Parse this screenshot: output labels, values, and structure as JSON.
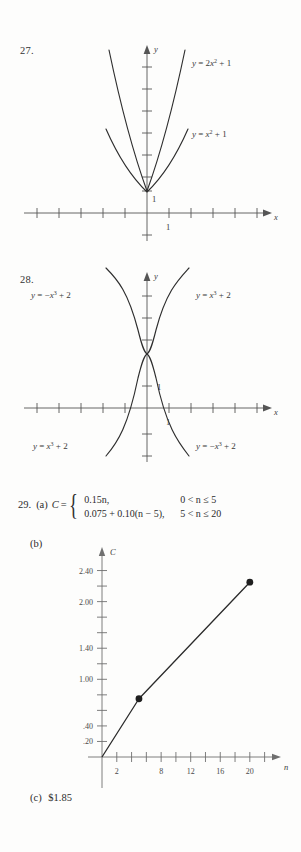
{
  "page": {
    "background": "#fdfdfc",
    "ink": "#2b2b2b"
  },
  "exercise27": {
    "number": "27.",
    "curve_labels": [
      {
        "lhs": "y",
        "eq": "=",
        "rhs_pre": "2x",
        "exp": "2",
        "rhs_post": "+ 1",
        "full": "y = 2x2 + 1"
      },
      {
        "lhs": "y",
        "eq": "=",
        "rhs_pre": "x",
        "exp": "2",
        "rhs_post": "+ 1",
        "full": "y = x2 + 1"
      }
    ],
    "axis_x_name": "x",
    "axis_y_name": "y",
    "y_mark": "1",
    "x_mark": "1"
  },
  "exercise28": {
    "number": "28.",
    "curve_labels": [
      {
        "prefix": "y",
        "eq": "=",
        "base": "−x",
        "exp": "3",
        "suffix": "+ 2",
        "full": "y = -x3 + 2",
        "position": "top-left"
      },
      {
        "prefix": "y",
        "eq": "=",
        "base": "x",
        "exp": "3",
        "suffix": "+ 2",
        "full": "y = x3 + 2",
        "position": "top-right"
      },
      {
        "prefix": "y",
        "eq": "=",
        "base": "x",
        "exp": "3",
        "suffix": "+ 2",
        "full": "y = x3 + 2",
        "position": "bottom-left"
      },
      {
        "prefix": "y",
        "eq": "=",
        "base": "−x",
        "exp": "3",
        "suffix": "+ 2",
        "full": "y = -x3 + 2",
        "position": "bottom-right"
      }
    ],
    "axis_x_name": "x",
    "axis_y_name": "y",
    "y_mark": "1",
    "x_mark": "1"
  },
  "exercise29": {
    "number": "29.",
    "part_a_label": "(a)",
    "part_b_label": "(b)",
    "part_c_label": "(c)",
    "function_name": "C",
    "equals": "=",
    "cases": [
      {
        "expression": "0.15n,",
        "condition": "0 < n ≤ 5"
      },
      {
        "expression": "0.075 + 0.10(n − 5),",
        "condition": "5 < n ≤ 20"
      }
    ],
    "answer_c": "$1.85"
  },
  "chart_data": {
    "type": "line",
    "title": "",
    "xlabel": "n",
    "ylabel": "C",
    "xlim": [
      0,
      23
    ],
    "ylim": [
      0,
      2.6
    ],
    "grid": false,
    "legend": false,
    "x_ticks": [
      2,
      4,
      6,
      8,
      10,
      12,
      14,
      16,
      18,
      20,
      22
    ],
    "x_tick_labels": [
      {
        "value": 2,
        "label": "2"
      },
      {
        "value": 8,
        "label": "8"
      },
      {
        "value": 12,
        "label": "12"
      },
      {
        "value": 16,
        "label": "16"
      },
      {
        "value": 20,
        "label": "20"
      }
    ],
    "y_ticks": [
      0.2,
      0.4,
      0.6,
      0.8,
      1.0,
      1.2,
      1.4,
      1.6,
      1.8,
      2.0,
      2.2,
      2.4
    ],
    "y_tick_labels": [
      {
        "value": 0.2,
        "label": ".20"
      },
      {
        "value": 0.4,
        "label": ".40"
      },
      {
        "value": 1.0,
        "label": "1.00"
      },
      {
        "value": 1.4,
        "label": "1.40"
      },
      {
        "value": 2.0,
        "label": "2.00"
      },
      {
        "value": 2.4,
        "label": "2.40"
      }
    ],
    "series": [
      {
        "name": "C(n)",
        "points": [
          {
            "x": 0,
            "y": 0
          },
          {
            "x": 5,
            "y": 0.75
          },
          {
            "x": 20,
            "y": 2.25
          }
        ],
        "markers": [
          {
            "x": 5,
            "y": 0.75
          },
          {
            "x": 20,
            "y": 2.25
          }
        ]
      }
    ]
  }
}
